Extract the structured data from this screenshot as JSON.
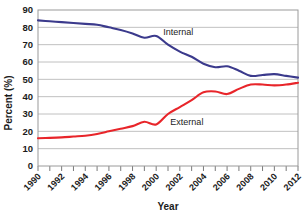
{
  "chart_data": {
    "type": "line",
    "title": "",
    "xlabel": "Year",
    "ylabel": "Percent (%)",
    "xlim": [
      1990,
      2012
    ],
    "ylim": [
      0,
      90
    ],
    "ytick_step": 10,
    "yticks": [
      "0",
      "10",
      "20",
      "30",
      "40",
      "50",
      "60",
      "70",
      "80",
      "90"
    ],
    "xticks": [
      "1990",
      "1992",
      "1994",
      "1996",
      "1998",
      "2000",
      "2002",
      "2004",
      "2006",
      "2008",
      "2010",
      "2012"
    ],
    "xtick_minor_step": 1,
    "grid": "horizontal",
    "legend": "inline-labels",
    "x": [
      1990,
      1991,
      1992,
      1993,
      1994,
      1995,
      1996,
      1997,
      1998,
      1999,
      2000,
      2001,
      2002,
      2003,
      2004,
      2005,
      2006,
      2007,
      2008,
      2009,
      2010,
      2011,
      2012
    ],
    "series": [
      {
        "name": "Internal",
        "color": "#3b3a8c",
        "label_x": 2000.6,
        "label_y": 75.5,
        "values": [
          84,
          83.5,
          83,
          82.5,
          82,
          81.5,
          80,
          78.5,
          76.5,
          74,
          75,
          70,
          66,
          63,
          59,
          57,
          57.5,
          55,
          52,
          52.5,
          53,
          52,
          51
        ]
      },
      {
        "name": "External",
        "color": "#e8252a",
        "label_x": 2001.2,
        "label_y": 23.5,
        "values": [
          16,
          16.2,
          16.5,
          17,
          17.5,
          18.5,
          20,
          21.5,
          23,
          25.5,
          24,
          30,
          34,
          38,
          42.5,
          43,
          41.5,
          44.5,
          47,
          47,
          46.5,
          47,
          48
        ]
      }
    ]
  },
  "axes": {
    "ylabel": "Percent (%)",
    "xlabel": "Year"
  }
}
